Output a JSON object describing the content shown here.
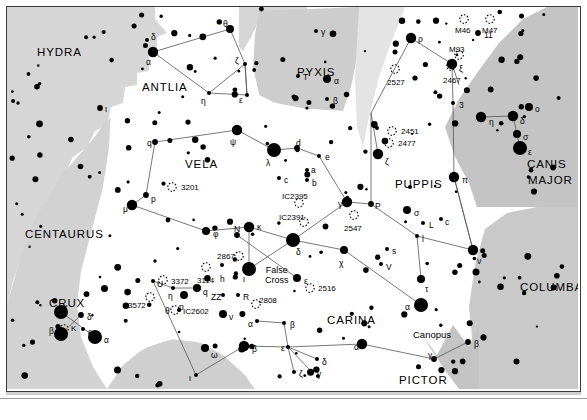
{
  "chart_data": {
    "type": "scatter",
    "xlabel": "",
    "ylabel": "",
    "grid": false,
    "legend_position": "none",
    "background": "#ffffff",
    "shade_light": "#d6d6d6",
    "shade_mid": "#c9c9c9",
    "shade_dark": "#b9b9b9",
    "line_color": "#555555",
    "star_color": "#000000",
    "constellations": [
      {
        "name": "HYDRA",
        "x": 30,
        "y": 40
      },
      {
        "name": "ANTLIA",
        "x": 135,
        "y": 75
      },
      {
        "name": "PYXIS",
        "x": 290,
        "y": 60
      },
      {
        "name": "VELA",
        "x": 178,
        "y": 152
      },
      {
        "name": "PUPPIS",
        "x": 388,
        "y": 172
      },
      {
        "name": "CANIS",
        "x": 520,
        "y": 152
      },
      {
        "name": "MAJOR",
        "x": 521,
        "y": 168
      },
      {
        "name": "CENTAURUS",
        "x": 18,
        "y": 222
      },
      {
        "name": "CRUX",
        "x": 42,
        "y": 291
      },
      {
        "name": "CARINA",
        "x": 320,
        "y": 308
      },
      {
        "name": "COLUMBA",
        "x": 513,
        "y": 275
      },
      {
        "name": "PICTOR",
        "x": 392,
        "y": 368
      },
      {
        "name": "VOLANS",
        "x": 238,
        "y": 382
      }
    ],
    "special_labels": [
      {
        "text": "False",
        "x": 258,
        "y": 258,
        "sub": "Cross"
      },
      {
        "text": "Canopus",
        "x": 406,
        "y": 323
      }
    ],
    "deep_sky": [
      {
        "name": "3201",
        "x": 165,
        "y": 180,
        "lx": 174,
        "ly": 177
      },
      {
        "name": "2527",
        "x": 388,
        "y": 62,
        "lx": 380,
        "ly": 72
      },
      {
        "name": "2467",
        "x": 444,
        "y": 59,
        "lx": 436,
        "ly": 70
      },
      {
        "name": "M93",
        "x": 452,
        "y": 48,
        "lx": 442,
        "ly": 39
      },
      {
        "name": "M46",
        "x": 457,
        "y": 12,
        "lx": 448,
        "ly": 20
      },
      {
        "name": "M47",
        "x": 483,
        "y": 12,
        "lx": 475,
        "ly": 20
      },
      {
        "name": "2451",
        "x": 385,
        "y": 124,
        "lx": 394,
        "ly": 121
      },
      {
        "name": "2477",
        "x": 382,
        "y": 136,
        "lx": 391,
        "ly": 133
      },
      {
        "name": "2547",
        "x": 347,
        "y": 208,
        "lx": 337,
        "ly": 218
      },
      {
        "name": "IC2395",
        "x": 292,
        "y": 196,
        "lx": 275,
        "ly": 186
      },
      {
        "name": "IC2391",
        "x": 297,
        "y": 215,
        "lx": 272,
        "ly": 207
      },
      {
        "name": "2516",
        "x": 303,
        "y": 281,
        "lx": 311,
        "ly": 278
      },
      {
        "name": "2808",
        "x": 249,
        "y": 297,
        "lx": 252,
        "ly": 290
      },
      {
        "name": "3114",
        "x": 199,
        "y": 260,
        "lx": 190,
        "ly": 270
      },
      {
        "name": "3372",
        "x": 156,
        "y": 273,
        "lx": 164,
        "ly": 271
      },
      {
        "name": "IC2602",
        "x": 168,
        "y": 303,
        "lx": 176,
        "ly": 301
      },
      {
        "name": "3572",
        "x": 143,
        "y": 290,
        "lx": 121,
        "ly": 295
      },
      {
        "name": "2867",
        "x": 232,
        "y": 249,
        "lx": 210,
        "ly": 246
      },
      {
        "name": "K",
        "x": 57,
        "y": 322,
        "lx": 64,
        "ly": 318
      }
    ],
    "stars": [
      {
        "g": "α",
        "x": 146,
        "y": 45,
        "m": 1,
        "lx": 139,
        "ly": 51
      },
      {
        "g": "δ",
        "x": 140,
        "y": 33,
        "m": 4,
        "lx": 144,
        "ly": 26
      },
      {
        "g": "θ",
        "x": 223,
        "y": 22,
        "m": 2,
        "lx": 216,
        "ly": 13
      },
      {
        "g": "ζ",
        "x": 238,
        "y": 57,
        "m": 4,
        "lx": 228,
        "ly": 50
      },
      {
        "g": "ε",
        "x": 240,
        "y": 88,
        "m": 4,
        "lx": 232,
        "ly": 89
      },
      {
        "g": "η",
        "x": 202,
        "y": 86,
        "m": 4,
        "lx": 194,
        "ly": 90
      },
      {
        "g": "ι",
        "x": 93,
        "y": 101,
        "m": 3,
        "lx": 98,
        "ly": 98
      },
      {
        "g": "γ",
        "x": 309,
        "y": 24,
        "m": 4,
        "lx": 314,
        "ly": 21
      },
      {
        "g": "T",
        "x": 291,
        "y": 69,
        "m": 4,
        "lx": 296,
        "ly": 66
      },
      {
        "g": "α",
        "x": 320,
        "y": 72,
        "m": 2,
        "lx": 327,
        "ly": 70
      },
      {
        "g": "β",
        "x": 320,
        "y": 92,
        "m": 4,
        "lx": 326,
        "ly": 90
      },
      {
        "g": "q",
        "x": 148,
        "y": 135,
        "m": 3,
        "lx": 140,
        "ly": 132
      },
      {
        "g": "ψ",
        "x": 230,
        "y": 123,
        "m": 1,
        "lx": 223,
        "ly": 131
      },
      {
        "g": "λ",
        "x": 267,
        "y": 143,
        "m": 0,
        "lx": 259,
        "ly": 152
      },
      {
        "g": "p",
        "x": 139,
        "y": 188,
        "m": 3,
        "lx": 144,
        "ly": 188
      },
      {
        "g": "μ",
        "x": 125,
        "y": 198,
        "m": 1,
        "lx": 116,
        "ly": 198
      },
      {
        "g": "φ",
        "x": 199,
        "y": 224,
        "m": 2,
        "lx": 206,
        "ly": 223
      },
      {
        "g": "κ",
        "x": 242,
        "y": 220,
        "m": 1,
        "lx": 250,
        "ly": 216
      },
      {
        "g": "N",
        "x": 230,
        "y": 228,
        "m": 3,
        "lx": 227,
        "ly": 218
      },
      {
        "g": "δ",
        "x": 286,
        "y": 233,
        "m": 0,
        "lx": 289,
        "ly": 241
      },
      {
        "g": "d",
        "x": 290,
        "y": 141,
        "m": 3,
        "lx": 289,
        "ly": 132
      },
      {
        "g": "e",
        "x": 312,
        "y": 149,
        "m": 4,
        "lx": 318,
        "ly": 146
      },
      {
        "g": "a",
        "x": 300,
        "y": 163,
        "m": 4,
        "lx": 304,
        "ly": 159
      },
      {
        "g": "b",
        "x": 300,
        "y": 173,
        "m": 4,
        "lx": 305,
        "ly": 172
      },
      {
        "g": "c",
        "x": 272,
        "y": 171,
        "m": 4,
        "lx": 277,
        "ly": 169
      },
      {
        "g": "γ",
        "x": 340,
        "y": 195,
        "m": 1,
        "lx": 331,
        "ly": 193
      },
      {
        "g": "χ",
        "x": 337,
        "y": 243,
        "m": 2,
        "lx": 332,
        "ly": 252
      },
      {
        "g": "ι",
        "x": 242,
        "y": 262,
        "m": 0,
        "lx": 236,
        "ly": 268
      },
      {
        "g": "h",
        "x": 215,
        "y": 258,
        "m": 4,
        "lx": 213,
        "ly": 268
      },
      {
        "g": "ε",
        "x": 290,
        "y": 271,
        "m": 2,
        "lx": 297,
        "ly": 270
      },
      {
        "g": "U",
        "x": 146,
        "y": 274,
        "m": 4,
        "lx": 150,
        "ly": 273
      },
      {
        "g": "η",
        "x": 166,
        "y": 281,
        "m": 4,
        "lx": 161,
        "ly": 285
      },
      {
        "g": "p",
        "x": 177,
        "y": 288,
        "m": 2,
        "lx": 172,
        "ly": 296
      },
      {
        "g": "q",
        "x": 190,
        "y": 281,
        "m": 2,
        "lx": 196,
        "ly": 281
      },
      {
        "g": "ZZ",
        "x": 216,
        "y": 288,
        "m": 4,
        "lx": 204,
        "ly": 286
      },
      {
        "g": "R",
        "x": 231,
        "y": 288,
        "m": 4,
        "lx": 236,
        "ly": 286
      },
      {
        "g": "θ",
        "x": 172,
        "y": 303,
        "m": 4,
        "lx": 158,
        "ly": 300
      },
      {
        "g": "ν",
        "x": 216,
        "y": 307,
        "m": 2,
        "lx": 222,
        "ly": 306
      },
      {
        "g": "α",
        "x": 250,
        "y": 314,
        "m": 4,
        "lx": 241,
        "ly": 313
      },
      {
        "g": "β",
        "x": 277,
        "y": 316,
        "m": 4,
        "lx": 283,
        "ly": 314
      },
      {
        "g": "ω",
        "x": 198,
        "y": 341,
        "m": 2,
        "lx": 204,
        "ly": 344
      },
      {
        "g": "β",
        "x": 237,
        "y": 339,
        "m": 1,
        "lx": 245,
        "ly": 338
      },
      {
        "g": "ε",
        "x": 281,
        "y": 340,
        "m": 4,
        "lx": 274,
        "ly": 337
      },
      {
        "g": "ι",
        "x": 189,
        "y": 368,
        "m": 4,
        "lx": 182,
        "ly": 367
      },
      {
        "g": "δ",
        "x": 310,
        "y": 352,
        "m": 4,
        "lx": 315,
        "ly": 351
      },
      {
        "g": "ζ",
        "x": 287,
        "y": 365,
        "m": 4,
        "lx": 292,
        "ly": 363
      },
      {
        "g": "γ",
        "x": 305,
        "y": 365,
        "m": 4,
        "lx": 310,
        "ly": 363
      },
      {
        "g": "γ",
        "x": 54,
        "y": 305,
        "m": 0,
        "lx": 56,
        "ly": 296
      },
      {
        "g": "δ",
        "x": 74,
        "y": 308,
        "m": 3,
        "lx": 80,
        "ly": 306
      },
      {
        "g": "ε",
        "x": 76,
        "y": 322,
        "m": 4,
        "lx": 81,
        "ly": 321
      },
      {
        "g": "β",
        "x": 54,
        "y": 327,
        "m": 0,
        "lx": 42,
        "ly": 320
      },
      {
        "g": "α",
        "x": 88,
        "y": 330,
        "m": 0,
        "lx": 97,
        "ly": 329
      },
      {
        "g": "α",
        "x": 414,
        "y": 298,
        "m": 0,
        "lx": 398,
        "ly": 296
      },
      {
        "g": "α",
        "x": 355,
        "y": 337,
        "m": 1,
        "lx": 347,
        "ly": 336
      },
      {
        "g": "γ",
        "x": 427,
        "y": 352,
        "m": 3,
        "lx": 421,
        "ly": 344
      },
      {
        "g": "β",
        "x": 461,
        "y": 335,
        "m": 3,
        "lx": 467,
        "ly": 333
      },
      {
        "g": "ρ",
        "x": 404,
        "y": 31,
        "m": 1,
        "lx": 411,
        "ly": 28
      },
      {
        "g": "11",
        "x": 471,
        "y": 26,
        "m": 3,
        "lx": 477,
        "ly": 24
      },
      {
        "g": "ξ",
        "x": 445,
        "y": 57,
        "m": 1,
        "lx": 452,
        "ly": 58
      },
      {
        "g": "3",
        "x": 446,
        "y": 96,
        "m": 4,
        "lx": 452,
        "ly": 94
      },
      {
        "g": "ζ",
        "x": 371,
        "y": 147,
        "m": 1,
        "lx": 378,
        "ly": 151
      },
      {
        "g": "P",
        "x": 364,
        "y": 197,
        "m": 3,
        "lx": 368,
        "ly": 195
      },
      {
        "g": "σ",
        "x": 400,
        "y": 203,
        "m": 2,
        "lx": 407,
        "ly": 202
      },
      {
        "g": "π",
        "x": 447,
        "y": 170,
        "m": 1,
        "lx": 455,
        "ly": 169
      },
      {
        "g": "L",
        "x": 416,
        "y": 216,
        "m": 4,
        "lx": 422,
        "ly": 214
      },
      {
        "g": "c",
        "x": 434,
        "y": 212,
        "m": 4,
        "lx": 438,
        "ly": 211
      },
      {
        "g": "l",
        "x": 410,
        "y": 229,
        "m": 4,
        "lx": 415,
        "ly": 228
      },
      {
        "g": "τ",
        "x": 414,
        "y": 272,
        "m": 2,
        "lx": 418,
        "ly": 278
      },
      {
        "g": "ν",
        "x": 466,
        "y": 243,
        "m": 1,
        "lx": 470,
        "ly": 250
      },
      {
        "g": "s",
        "x": 380,
        "y": 242,
        "m": 4,
        "lx": 385,
        "ly": 240
      },
      {
        "g": "V",
        "x": 374,
        "y": 257,
        "m": 4,
        "lx": 379,
        "ly": 256
      },
      {
        "g": "η",
        "x": 474,
        "y": 110,
        "m": 1,
        "lx": 482,
        "ly": 111
      },
      {
        "g": "δ",
        "x": 506,
        "y": 109,
        "m": 1,
        "lx": 513,
        "ly": 110
      },
      {
        "g": "o",
        "x": 522,
        "y": 100,
        "m": 2,
        "lx": 528,
        "ly": 98
      },
      {
        "g": "σ",
        "x": 510,
        "y": 127,
        "m": 2,
        "lx": 516,
        "ly": 126
      },
      {
        "g": "ε",
        "x": 513,
        "y": 141,
        "m": 0,
        "lx": 521,
        "ly": 141
      }
    ]
  }
}
